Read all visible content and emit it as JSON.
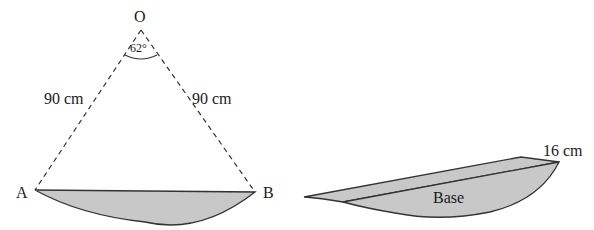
{
  "left_figure": {
    "vertex_label": "O",
    "angle_label": "62°",
    "left_radius_label": "90 cm",
    "right_radius_label": "90 cm",
    "point_a_label": "A",
    "point_b_label": "B"
  },
  "right_figure": {
    "thickness_label": "16 cm",
    "base_label": "Base"
  },
  "colors": {
    "fill": "#c8c8c8",
    "stroke": "#333333"
  }
}
